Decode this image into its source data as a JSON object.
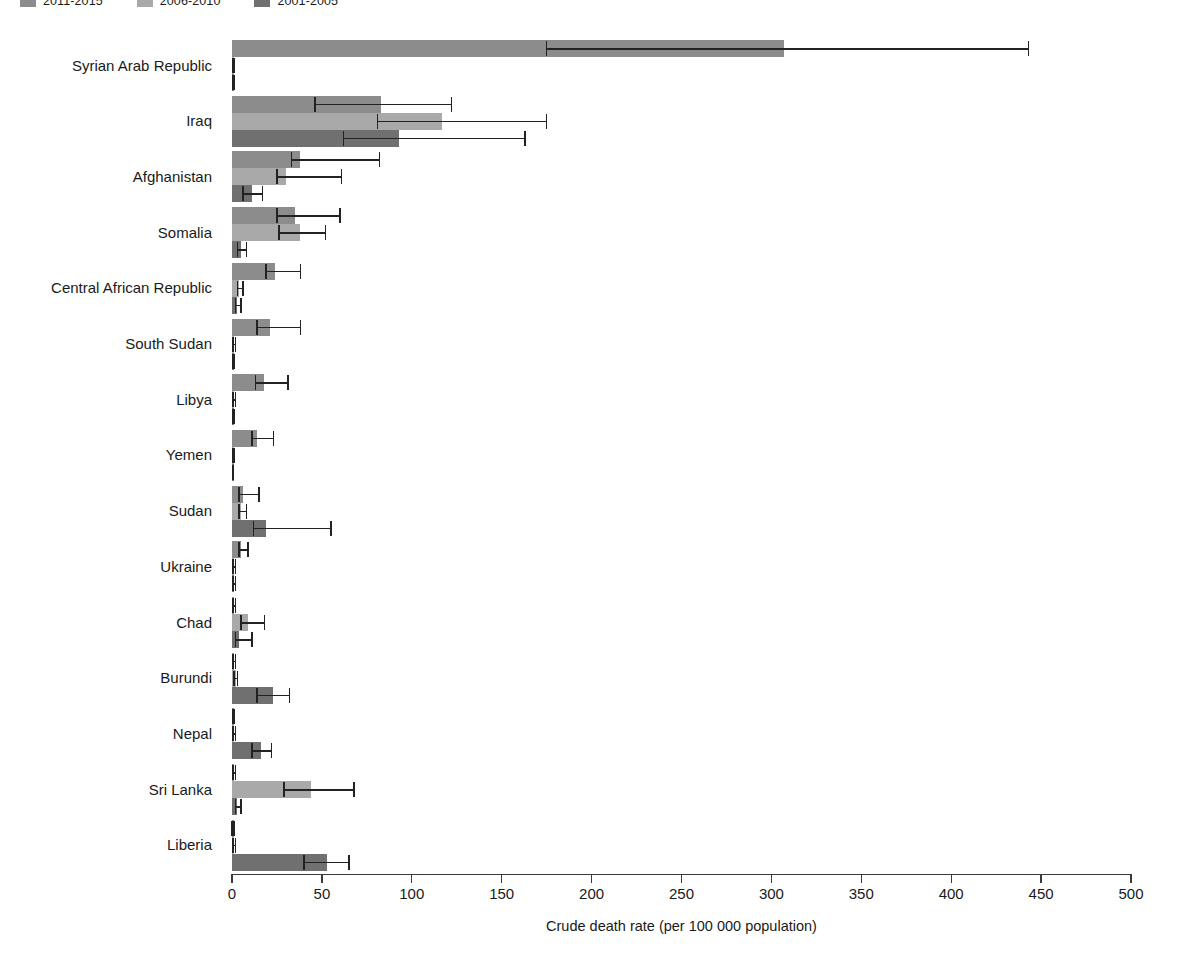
{
  "chart_data": {
    "type": "bar",
    "orientation": "horizontal",
    "title": "",
    "xlabel": "Crude death rate (per 100 000 population)",
    "ylabel": "",
    "xlim": [
      0,
      500
    ],
    "xticks": [
      0,
      50,
      100,
      150,
      200,
      250,
      300,
      350,
      400,
      450,
      500
    ],
    "grid": false,
    "legend_position": "top-left",
    "categories": [
      "Syrian Arab Republic",
      "Iraq",
      "Afghanistan",
      "Somalia",
      "Central African Republic",
      "South Sudan",
      "Libya",
      "Yemen",
      "Sudan",
      "Ukraine",
      "Chad",
      "Burundi",
      "Nepal",
      "Sri Lanka",
      "Liberia"
    ],
    "series": [
      {
        "name": "2011-2015",
        "color": "#8c8c8c",
        "values": [
          307,
          83,
          38,
          35,
          24,
          21,
          18,
          14,
          6,
          5,
          1,
          1,
          0.4,
          1,
          0.3
        ],
        "ci_low": [
          175,
          46,
          33,
          25,
          19,
          14,
          13,
          11,
          4,
          4,
          0.4,
          0.4,
          0.2,
          0.5,
          0.1
        ],
        "ci_high": [
          443,
          122,
          82,
          60,
          38,
          38,
          31,
          23,
          15,
          9,
          2,
          2,
          1,
          2,
          1
        ]
      },
      {
        "name": "2006-2010",
        "color": "#a9a9a9",
        "values": [
          0.9,
          117,
          30,
          38,
          4,
          0.9,
          0.9,
          0.5,
          5,
          0.9,
          9,
          2,
          0.9,
          44,
          1
        ],
        "ci_low": [
          0.4,
          81,
          25,
          26,
          3,
          0.4,
          0.4,
          0.2,
          4,
          0.4,
          5,
          1,
          0.4,
          29,
          0.5
        ],
        "ci_high": [
          1.5,
          175,
          61,
          52,
          6,
          2,
          2,
          1,
          8,
          2,
          18,
          3,
          2,
          68,
          2
        ]
      },
      {
        "name": "2001-2005",
        "color": "#707070",
        "values": [
          0.9,
          93,
          11,
          5,
          3,
          0.4,
          0.5,
          0.4,
          19,
          1,
          4,
          23,
          16,
          3,
          53
        ],
        "ci_low": [
          0.4,
          62,
          6,
          3,
          2,
          0.2,
          0.2,
          0.2,
          12,
          0.4,
          2,
          14,
          11,
          2,
          40
        ],
        "ci_high": [
          1.5,
          163,
          17,
          8,
          5,
          1,
          1,
          0.8,
          55,
          2,
          11,
          32,
          22,
          5,
          65
        ]
      }
    ]
  },
  "legend": {
    "items": [
      {
        "label": "2011-2015",
        "color": "#8c8c8c"
      },
      {
        "label": "2006-2010",
        "color": "#a9a9a9"
      },
      {
        "label": "2001-2005",
        "color": "#707070"
      }
    ]
  },
  "axis": {
    "x_title": "Crude death rate (per 100 000 population)"
  }
}
